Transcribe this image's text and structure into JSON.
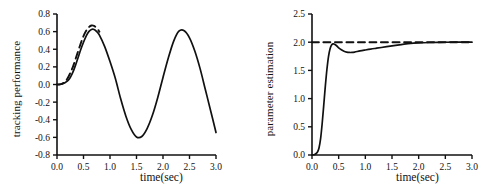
{
  "figure": {
    "background": "#ffffff",
    "curve_color": "#111111"
  },
  "chart_data": [
    {
      "type": "line",
      "panel": "left",
      "title": "",
      "xlabel": "time(sec)",
      "ylabel": "tracking performance",
      "xlim": [
        0.0,
        3.0
      ],
      "ylim": [
        -0.8,
        0.8
      ],
      "xticks": [
        "0.0",
        "0.5",
        "1.0",
        "1.5",
        "2.0",
        "2.5",
        "3.0"
      ],
      "yticks": [
        "0.8",
        "0.6",
        "0.4",
        "0.2",
        "0.0",
        "-0.2",
        "-0.4",
        "-0.6",
        "-0.8"
      ],
      "grid": false,
      "legend": "none",
      "series": [
        {
          "name": "reference (dashed)",
          "style": "dashed",
          "x": [
            0.0,
            0.05,
            0.1,
            0.15,
            0.2,
            0.25,
            0.3,
            0.35,
            0.4,
            0.45,
            0.5,
            0.55,
            0.6,
            0.65,
            0.7,
            0.75,
            0.8
          ],
          "y": [
            0.0,
            0.0,
            0.01,
            0.03,
            0.07,
            0.13,
            0.2,
            0.29,
            0.38,
            0.47,
            0.55,
            0.61,
            0.65,
            0.67,
            0.665,
            0.64,
            0.6
          ]
        },
        {
          "name": "output (solid)",
          "style": "solid",
          "x": [
            0.0,
            0.1,
            0.2,
            0.25,
            0.3,
            0.35,
            0.4,
            0.45,
            0.5,
            0.55,
            0.6,
            0.65,
            0.7,
            0.75,
            0.8,
            0.9,
            1.0,
            1.1,
            1.2,
            1.3,
            1.4,
            1.5,
            1.6,
            1.7,
            1.8,
            1.9,
            2.0,
            2.1,
            2.2,
            2.3,
            2.4,
            2.5,
            2.6,
            2.7,
            2.8,
            2.9,
            3.0
          ],
          "y": [
            0.0,
            0.005,
            0.04,
            0.08,
            0.14,
            0.22,
            0.31,
            0.4,
            0.48,
            0.55,
            0.6,
            0.625,
            0.625,
            0.6,
            0.56,
            0.43,
            0.26,
            0.07,
            -0.16,
            -0.36,
            -0.51,
            -0.595,
            -0.59,
            -0.5,
            -0.35,
            -0.15,
            0.08,
            0.3,
            0.49,
            0.605,
            0.61,
            0.53,
            0.38,
            0.18,
            -0.06,
            -0.3,
            -0.545
          ]
        }
      ]
    },
    {
      "type": "line",
      "panel": "right",
      "title": "",
      "xlabel": "time(sec)",
      "ylabel": "parameter estimation",
      "xlim": [
        0.0,
        3.0
      ],
      "ylim": [
        0.0,
        2.5
      ],
      "xticks": [
        "0.0",
        "0.5",
        "1.0",
        "1.5",
        "2.0",
        "2.5",
        "3.0"
      ],
      "yticks": [
        "2.5",
        "2.0",
        "1.5",
        "1.0",
        "0.5",
        "0.0"
      ],
      "grid": false,
      "legend": "none",
      "series": [
        {
          "name": "true value (dashed)",
          "style": "dashed",
          "x": [
            0.0,
            3.0
          ],
          "y": [
            2.0,
            2.0
          ]
        },
        {
          "name": "estimate (solid)",
          "style": "solid",
          "x": [
            0.0,
            0.05,
            0.1,
            0.13,
            0.16,
            0.19,
            0.22,
            0.25,
            0.28,
            0.31,
            0.34,
            0.37,
            0.4,
            0.45,
            0.5,
            0.55,
            0.6,
            0.65,
            0.7,
            0.75,
            0.8,
            0.9,
            1.0,
            1.1,
            1.2,
            1.3,
            1.4,
            1.5,
            1.6,
            1.7,
            1.8,
            2.0,
            2.2,
            2.5,
            2.75,
            3.0
          ],
          "y": [
            0.0,
            0.01,
            0.05,
            0.12,
            0.28,
            0.55,
            0.88,
            1.22,
            1.52,
            1.75,
            1.89,
            1.955,
            1.97,
            1.945,
            1.9,
            1.865,
            1.84,
            1.825,
            1.818,
            1.818,
            1.825,
            1.845,
            1.862,
            1.878,
            1.892,
            1.906,
            1.92,
            1.934,
            1.948,
            1.962,
            1.974,
            1.988,
            1.995,
            1.999,
            2.0,
            2.0
          ]
        }
      ]
    }
  ]
}
